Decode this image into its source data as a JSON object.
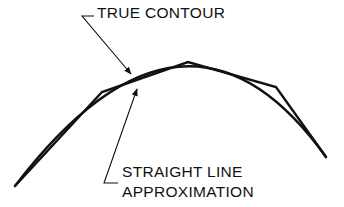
{
  "diagram": {
    "labels": {
      "true_contour": "TRUE CONTOUR",
      "straight_line_line1": "STRAIGHT LINE",
      "straight_line_line2": "APPROXIMATION"
    },
    "colors": {
      "stroke": "#111111",
      "background": "#ffffff"
    },
    "elements": {
      "true_contour_arc": {
        "start": [
          15,
          186
        ],
        "control": [
          185,
          0
        ],
        "end": [
          326,
          157
        ]
      },
      "polygon_vertices": [
        [
          15,
          186
        ],
        [
          102,
          92
        ],
        [
          188,
          62
        ],
        [
          276,
          87
        ],
        [
          326,
          157
        ]
      ]
    }
  }
}
